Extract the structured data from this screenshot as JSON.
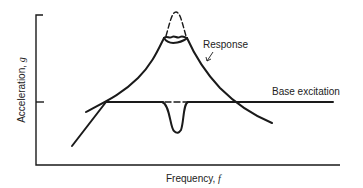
{
  "figure": {
    "y_axis_label": "Acceleration, ",
    "y_axis_symbol": "g",
    "x_axis_label": "Frequency, ",
    "x_axis_symbol": "f",
    "curves": [
      {
        "name": "Response",
        "label": "Response"
      },
      {
        "name": "Base excitation",
        "label": "Base excitation"
      }
    ],
    "colors": {
      "line": "#1a1a1a",
      "background": "#ffffff"
    }
  }
}
